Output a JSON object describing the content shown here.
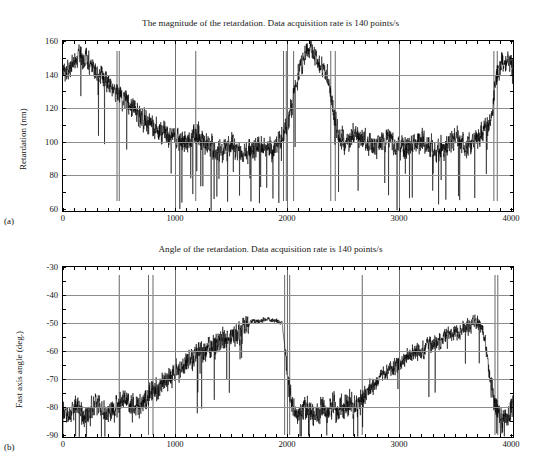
{
  "figure": {
    "panels": [
      {
        "letter": "(a)",
        "title": "The magnitude of the retardation.  Data acquisition rate is 140 points/s",
        "ylabel": "Retardation (nm)",
        "xticks": [
          "0",
          "1000",
          "2000",
          "3000",
          "4000"
        ],
        "yticks": [
          "60",
          "80",
          "100",
          "120",
          "140",
          "160"
        ]
      },
      {
        "letter": "(b)",
        "title": "Angle of the retardation.  Data acquisition rate is 140 points/s",
        "ylabel": "Fast axis angle (deg.)",
        "xticks": [
          "0",
          "1000",
          "2000",
          "3000",
          "4000"
        ],
        "yticks": [
          "-90",
          "-80",
          "-70",
          "-60",
          "-50",
          "-40",
          "-30"
        ]
      }
    ]
  },
  "chart_data": [
    {
      "type": "line",
      "title": "The magnitude of the retardation.  Data acquisition rate is 140 points/s",
      "xlabel": "",
      "ylabel": "Retardation (nm)",
      "xlim": [
        0,
        4000
      ],
      "ylim": [
        60,
        160
      ],
      "xticks": [
        0,
        1000,
        2000,
        3000,
        4000
      ],
      "yticks": [
        60,
        80,
        100,
        120,
        140,
        160
      ],
      "grid": true,
      "legend": "none",
      "line_color": "#000000",
      "description": "Noisy retardation trace: starts near 140-150 nm with dense high-frequency noise, drops to a plateau near 95-105 nm between x=500 and x=2000 with frequent downward spikes to 60-80 nm, jumps back up to ~140-155 nm at x=2100-2350, falls back to ~95-110 nm for x=2400-3800 with spikes, then rises to ~135-150 nm at x=3850-4000.",
      "x": [
        0,
        50,
        100,
        150,
        200,
        250,
        300,
        350,
        400,
        450,
        500,
        550,
        600,
        650,
        700,
        750,
        800,
        850,
        900,
        950,
        1000,
        1050,
        1100,
        1150,
        1200,
        1250,
        1300,
        1350,
        1400,
        1450,
        1500,
        1550,
        1600,
        1650,
        1700,
        1750,
        1800,
        1850,
        1900,
        1950,
        2000,
        2050,
        2100,
        2150,
        2200,
        2250,
        2300,
        2350,
        2400,
        2450,
        2500,
        2550,
        2600,
        2650,
        2700,
        2750,
        2800,
        2850,
        2900,
        2950,
        3000,
        3050,
        3100,
        3150,
        3200,
        3250,
        3300,
        3350,
        3400,
        3450,
        3500,
        3550,
        3600,
        3650,
        3700,
        3750,
        3800,
        3850,
        3900,
        3950,
        4000
      ],
      "y": [
        140,
        143,
        148,
        152,
        150,
        146,
        141,
        138,
        136,
        132,
        128,
        124,
        121,
        118,
        116,
        113,
        110,
        108,
        106,
        104,
        103,
        101,
        100,
        102,
        104,
        101,
        98,
        96,
        95,
        97,
        99,
        96,
        93,
        95,
        98,
        100,
        97,
        95,
        99,
        104,
        110,
        128,
        143,
        152,
        156,
        150,
        145,
        140,
        120,
        104,
        100,
        102,
        105,
        103,
        100,
        98,
        99,
        101,
        103,
        100,
        98,
        97,
        99,
        101,
        100,
        98,
        96,
        97,
        99,
        101,
        103,
        100,
        98,
        100,
        104,
        108,
        112,
        138,
        146,
        149,
        145
      ]
    },
    {
      "type": "line",
      "title": "Angle of the retardation.  Data acquisition rate is 140 points/s",
      "xlabel": "",
      "ylabel": "Fast axis angle (deg.)",
      "xlim": [
        0,
        4000
      ],
      "ylim": [
        -90,
        -30
      ],
      "xticks": [
        0,
        1000,
        2000,
        3000,
        4000
      ],
      "yticks": [
        -90,
        -80,
        -70,
        -60,
        -50,
        -40,
        -30
      ],
      "grid": true,
      "legend": "none",
      "line_color": "#000000",
      "description": "Noisy fast-axis angle trace: begins near -80 deg with large excursions down to -88, rises gradually through -70 and -60 between x=900 and x=1600, reaches a smooth plateau near -48 to -50 deg from x=1650 to x=1950, drops abruptly to about -80 deg for x=2000-2600 with heavy noise, then climbs steadily from -75 to -50 deg between x=2700 and x=3700, and finally collapses back to about -80 to -88 deg for x=3850-4000.",
      "x": [
        0,
        50,
        100,
        150,
        200,
        250,
        300,
        350,
        400,
        450,
        500,
        550,
        600,
        650,
        700,
        750,
        800,
        850,
        900,
        950,
        1000,
        1050,
        1100,
        1150,
        1200,
        1250,
        1300,
        1350,
        1400,
        1450,
        1500,
        1550,
        1600,
        1650,
        1700,
        1750,
        1800,
        1850,
        1900,
        1950,
        2000,
        2050,
        2100,
        2150,
        2200,
        2250,
        2300,
        2350,
        2400,
        2450,
        2500,
        2550,
        2600,
        2650,
        2700,
        2750,
        2800,
        2850,
        2900,
        2950,
        3000,
        3050,
        3100,
        3150,
        3200,
        3250,
        3300,
        3350,
        3400,
        3450,
        3500,
        3550,
        3600,
        3650,
        3700,
        3750,
        3800,
        3850,
        3900,
        3950,
        4000
      ],
      "y": [
        -80,
        -82,
        -79,
        -81,
        -83,
        -80,
        -78,
        -80,
        -82,
        -80,
        -78,
        -77,
        -79,
        -80,
        -78,
        -76,
        -74,
        -73,
        -71,
        -69,
        -67,
        -66,
        -64,
        -62,
        -60,
        -61,
        -59,
        -57,
        -56,
        -55,
        -54,
        -53,
        -52,
        -50,
        -49,
        -49,
        -48,
        -49,
        -49,
        -50,
        -70,
        -80,
        -82,
        -79,
        -81,
        -83,
        -80,
        -82,
        -79,
        -81,
        -80,
        -78,
        -80,
        -76,
        -74,
        -72,
        -70,
        -68,
        -67,
        -65,
        -64,
        -62,
        -61,
        -60,
        -59,
        -58,
        -57,
        -56,
        -55,
        -54,
        -53,
        -52,
        -51,
        -50,
        -50,
        -55,
        -70,
        -80,
        -84,
        -82,
        -80
      ]
    }
  ]
}
